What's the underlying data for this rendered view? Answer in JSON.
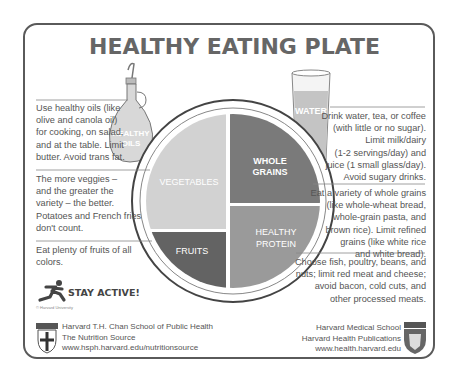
{
  "title": "HEALTHY EATING PLATE",
  "colors": {
    "vegetables": "#d2d2d2",
    "whole_grains": "#7a7a7a",
    "healthy_protein": "#9a9a9a",
    "fruits": "#636363",
    "border": "#5a5a5a",
    "text": "#555555"
  },
  "plate": {
    "vegetables": "VEGETABLES",
    "whole_grains_1": "WHOLE",
    "whole_grains_2": "GRAINS",
    "healthy_protein_1": "HEALTHY",
    "healthy_protein_2": "PROTEIN",
    "fruits": "FRUITS"
  },
  "oil": {
    "label_1": "HEALTHY",
    "label_2": "OILS",
    "text": [
      "Use healthy oils (like",
      "olive and canola oil)",
      "for cooking, on salad,",
      "and at the table. Limit",
      "butter. Avoid trans fat."
    ]
  },
  "vegetables_note": [
    "The more veggies –",
    "and the greater the",
    "variety – the better.",
    "Potatoes and French fries",
    "don't count."
  ],
  "fruits_note": [
    "Eat plenty of fruits of all",
    "colors."
  ],
  "water": {
    "label": "WATER",
    "text": [
      "Drink water, tea, or coffee",
      "(with little or no sugar).",
      "Limit milk/dairy",
      "(1-2 servings/day) and",
      "juice (1 small glass/day).",
      "Avoid sugary drinks."
    ]
  },
  "grains_note": [
    "Eat a variety of whole grains",
    "(like whole-wheat bread,",
    "whole-grain pasta, and",
    "brown rice). Limit refined",
    "grains (like white rice",
    "and white bread)."
  ],
  "protein_note": [
    "Choose fish, poultry, beans, and",
    "nuts; limit red meat and cheese;",
    "avoid bacon, cold cuts, and",
    "other processed meats."
  ],
  "stay_active": "STAY ACTIVE!",
  "copyright": "© Harvard University",
  "footer_left": [
    "Harvard T.H. Chan School of Public Health",
    "The Nutrition Source",
    "www.hsph.harvard.edu/nutritionsource"
  ],
  "footer_right": [
    "Harvard Medical School",
    "Harvard Health Publications",
    "www.health.harvard.edu"
  ]
}
